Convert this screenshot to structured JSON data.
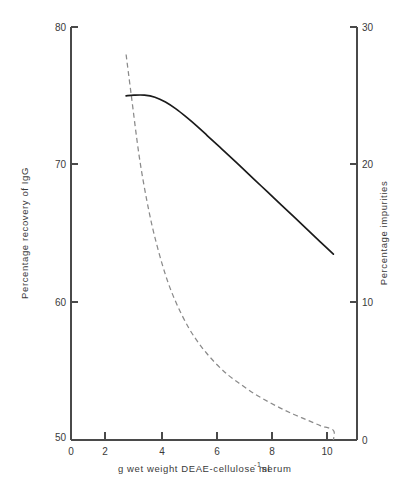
{
  "chart_data": {
    "type": "line",
    "title": "",
    "subtitle": "",
    "xlabel": "g wet weight DEAE-cellulose ml⁻¹ serum",
    "ylabel": "Percentage recovery of IgG",
    "ylabel_right": "Percentage impurities",
    "xlim": [
      0,
      10.9
    ],
    "ylim": [
      50,
      80
    ],
    "ylim_right": [
      0,
      30
    ],
    "xticks": [
      0,
      2,
      4,
      6,
      8,
      10
    ],
    "xtick_labels": [
      "0",
      "2",
      "4",
      "6",
      "8",
      "10"
    ],
    "yticks": [
      50,
      60,
      70,
      80
    ],
    "ytick_labels": [
      "50",
      "60",
      "70",
      "80"
    ],
    "yticks_right": [
      0,
      10,
      20,
      30
    ],
    "ytick_labels_right": [
      "0",
      "10",
      "20",
      "30"
    ],
    "grid": false,
    "legend": "none",
    "series": [
      {
        "name": "Percentage recovery of IgG",
        "axis": "left",
        "style": "solid",
        "color": "#1a1a1a",
        "x": [
          2.1,
          2.4,
          2.8,
          3.2,
          3.6,
          4.0,
          4.4,
          4.8,
          5.2,
          5.6,
          6.0,
          6.5,
          7.0,
          7.5,
          8.0,
          8.5,
          9.0,
          9.5,
          10.0
        ],
        "y": [
          75.0,
          75.05,
          75.05,
          74.9,
          74.55,
          74.05,
          73.45,
          72.8,
          72.1,
          71.4,
          70.7,
          69.8,
          68.9,
          68.0,
          67.1,
          66.2,
          65.3,
          64.4,
          63.5
        ]
      },
      {
        "name": "Percentage impurities",
        "axis": "right",
        "style": "dashed",
        "color": "#8a8a8a",
        "x": [
          2.1,
          2.3,
          2.6,
          2.9,
          3.2,
          3.6,
          4.0,
          4.5,
          5.0,
          5.5,
          6.0,
          6.5,
          7.0,
          7.5,
          8.0,
          8.5,
          9.0,
          9.5,
          10.0,
          10.0
        ],
        "y": [
          28.0,
          25.0,
          20.6,
          17.3,
          14.7,
          12.0,
          10.0,
          8.1,
          6.7,
          5.6,
          4.7,
          4.0,
          3.35,
          2.8,
          2.3,
          1.85,
          1.45,
          1.05,
          0.7,
          0.0
        ]
      }
    ]
  },
  "axes": {
    "left_title": "Percentage recovery of IgG",
    "right_title": "Percentage impurities",
    "bottom_title": "g wet weight DEAE-cellulose ml",
    "bottom_title_sup": "-1",
    "bottom_title_tail": "serum"
  }
}
